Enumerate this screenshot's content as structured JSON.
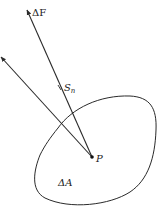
{
  "diagram": {
    "type": "stress-vector-figure",
    "colors": {
      "ink": "#2a2a2a",
      "background": "#ffffff"
    },
    "labels": {
      "force": "ΔF",
      "stress": "S",
      "stress_sub": "n",
      "point": "P",
      "area": "ΔA"
    },
    "elements": [
      {
        "id": "force-vector",
        "from": "P",
        "to": "top",
        "label": "ΔF"
      },
      {
        "id": "stress-vector",
        "from": "P",
        "to": "upper-left",
        "label": "S_n"
      },
      {
        "id": "area-region",
        "shape": "closed-curve",
        "label": "ΔA"
      },
      {
        "id": "point",
        "label": "P"
      }
    ]
  }
}
